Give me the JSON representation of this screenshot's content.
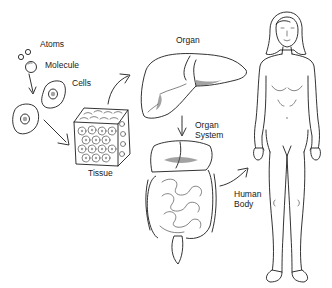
{
  "diagram": {
    "labels": {
      "atoms": "Atoms",
      "molecule": "Molecule",
      "cells": "Cells",
      "tissue": "Tissue",
      "organ": "Organ",
      "organ_system_line1": "Organ",
      "organ_system_line2": "System",
      "human_body_line1": "Human",
      "human_body_line2": "Body"
    },
    "sequence": [
      "Atoms",
      "Molecule",
      "Cells",
      "Tissue",
      "Organ",
      "Organ System",
      "Human Body"
    ],
    "colors": {
      "line": "#1c1c1c",
      "background": "#ffffff",
      "text": "#1a1a1a"
    }
  }
}
